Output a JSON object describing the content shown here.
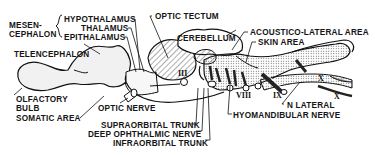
{
  "diagram": {
    "labels": {
      "mesencephalon_line1": "MESEN-",
      "mesencephalon_line2": "CEPHALON",
      "hypothalamus": "HYPOTHALAMUS",
      "thalamus": "THALAMUS",
      "epithalamus": "EPITHALAMUS",
      "optic_tectum": "OPTIC TECTUM",
      "cerebellum": "CEREBELLUM",
      "acoustico_lateral_area": "ACOUSTICO-LATERAL AREA",
      "skin_area": "SKIN AREA",
      "telencephalon": "TELENCEPHALON",
      "olfactory_bulb_line1": "OLFACTORY",
      "olfactory_bulb_line2": "BULB",
      "somatic_area": "SOMATIC AREA",
      "optic_nerve": "OPTIC NERVE",
      "supraorbital_trunk": "SUPRAORBITAL TRUNK",
      "deep_ophthalmic_nerve": "DEEP OPHTHALMIC NERVE",
      "infraorbital_trunk": "INFRAORBITAL TRUNK",
      "n_lateral": "N LATERAL",
      "hyomandibular_nerve": "HYOMANDIBULAR NERVE"
    },
    "cranial_nerve_numerals": {
      "III": "III",
      "VIII": "VIII",
      "IX": "IX",
      "X_upper": "X",
      "X_lower": "X"
    }
  }
}
